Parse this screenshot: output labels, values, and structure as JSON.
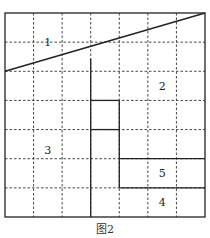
{
  "caption": "图2",
  "grid": {
    "cols": 7,
    "rows": 7
  },
  "region_labels": [
    {
      "id": "1",
      "col": 1.5,
      "row": 1.0
    },
    {
      "id": "2",
      "col": 5.5,
      "row": 2.5
    },
    {
      "id": "3",
      "col": 1.5,
      "row": 4.7
    },
    {
      "id": "5",
      "col": 5.5,
      "row": 5.5
    },
    {
      "id": "4",
      "col": 5.5,
      "row": 6.5
    }
  ],
  "diagonal": {
    "from": [
      0,
      2
    ],
    "to": [
      7,
      0
    ]
  },
  "solid_segments": [
    {
      "from": [
        3,
        1.57
      ],
      "to": [
        3,
        7
      ]
    },
    {
      "from": [
        3,
        3
      ],
      "to": [
        4,
        3
      ]
    },
    {
      "from": [
        3,
        4
      ],
      "to": [
        4,
        4
      ]
    },
    {
      "from": [
        4,
        3
      ],
      "to": [
        4,
        6
      ]
    },
    {
      "from": [
        4,
        5
      ],
      "to": [
        7,
        5
      ]
    },
    {
      "from": [
        4,
        6
      ],
      "to": [
        7,
        6
      ]
    }
  ]
}
